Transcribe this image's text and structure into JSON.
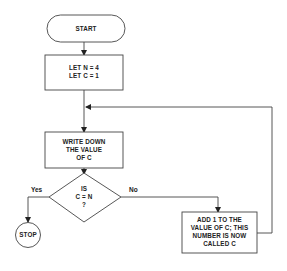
{
  "flowchart": {
    "start": {
      "label": "START"
    },
    "init": {
      "line1": "LET N = 4",
      "line2": "LET C = 1"
    },
    "write": {
      "line1": "WRITE DOWN",
      "line2": "THE VALUE",
      "line3": "OF C"
    },
    "decision": {
      "line1": "IS",
      "line2": "C = N",
      "line3": "?"
    },
    "branches": {
      "yes": "Yes",
      "no": "No"
    },
    "increment": {
      "line1": "ADD 1 TO THE",
      "line2": "VALUE OF C; THIS",
      "line3": "NUMBER IS NOW",
      "line4": "CALLED C"
    },
    "stop": {
      "label": "STOP"
    }
  },
  "colors": {
    "stroke": "#333333",
    "background": "#ffffff",
    "text": "#222222"
  }
}
